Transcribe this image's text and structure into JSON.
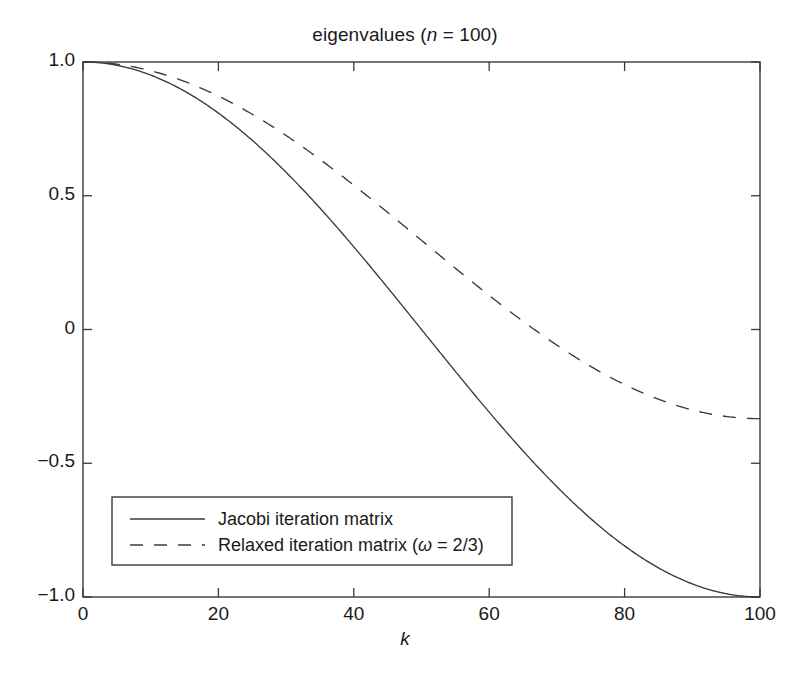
{
  "chart_data": {
    "type": "line",
    "title": "eigenvalues (n = 100)",
    "title_prefix": "eigenvalues (",
    "title_italic": "n",
    "title_suffix": " = 100)",
    "xlabel": "k",
    "ylabel": "",
    "xlim": [
      0,
      100
    ],
    "ylim": [
      -1.0,
      1.0
    ],
    "grid": false,
    "legend_position": "lower left",
    "xticks": [
      0,
      20,
      40,
      60,
      80,
      100
    ],
    "xtick_labels": [
      "0",
      "20",
      "40",
      "60",
      "80",
      "100"
    ],
    "yticks": [
      1.0,
      0.5,
      0,
      -0.5,
      -1.0
    ],
    "ytick_labels": [
      "1.0",
      "0.5",
      "0",
      "−0.5",
      "−1.0"
    ],
    "n": 100,
    "omega": "2/3",
    "series": [
      {
        "name": "Jacobi iteration matrix",
        "legend_label": "Jacobi iteration matrix",
        "style": "solid",
        "color": "#3a3a3a",
        "formula": "cos(k*pi/n)",
        "x": [
          0,
          5,
          10,
          15,
          20,
          25,
          30,
          35,
          40,
          45,
          50,
          55,
          60,
          65,
          70,
          75,
          80,
          85,
          90,
          95,
          100
        ],
        "values": [
          1.0,
          0.9877,
          0.9511,
          0.891,
          0.809,
          0.7071,
          0.5878,
          0.454,
          0.309,
          0.1564,
          0.0,
          -0.1564,
          -0.309,
          -0.454,
          -0.5878,
          -0.7071,
          -0.809,
          -0.891,
          -0.9511,
          -0.9877,
          -1.0
        ]
      },
      {
        "name": "Relaxed iteration matrix",
        "legend_label": "Relaxed iteration matrix (ω = 2/3)",
        "legend_label_prefix": "Relaxed iteration matrix (",
        "legend_label_italic": "ω",
        "legend_label_suffix": " = 2/3)",
        "style": "dashed",
        "color": "#3a3a3a",
        "formula": "1 - (2/3)*(1 - cos(k*pi/n))",
        "x": [
          0,
          5,
          10,
          15,
          20,
          25,
          30,
          35,
          40,
          45,
          50,
          55,
          60,
          65,
          70,
          75,
          80,
          85,
          90,
          95,
          100
        ],
        "values": [
          1.0,
          0.9918,
          0.9674,
          0.9273,
          0.8727,
          0.8047,
          0.7252,
          0.636,
          0.5393,
          0.4376,
          0.3333,
          0.2291,
          0.1273,
          0.0307,
          -0.0585,
          -0.1381,
          -0.206,
          -0.2607,
          -0.3007,
          -0.3251,
          -0.3333
        ]
      }
    ]
  },
  "axes": {
    "frame_color": "#3a3a3a"
  }
}
